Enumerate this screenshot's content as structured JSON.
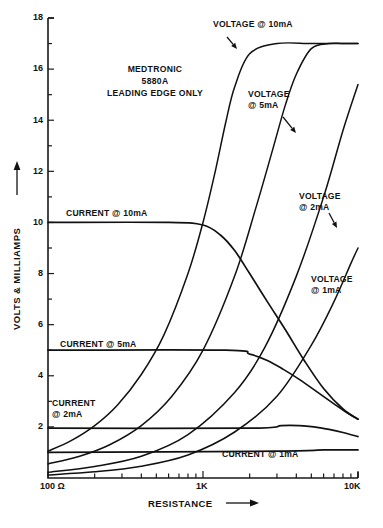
{
  "figure": {
    "title_block": [
      "MEDTRONIC",
      "5880A",
      "LEADING EDGE ONLY"
    ],
    "background_color": "#ffffff",
    "ink_color": "#111111"
  },
  "chart_data": {
    "type": "line",
    "title": "MEDTRONIC 5880A LEADING EDGE ONLY",
    "xlabel": "RESISTANCE",
    "ylabel": "VOLTS & MILLIAMPS",
    "x_scale": "log",
    "xlim": [
      100,
      10000
    ],
    "ylim": [
      0,
      18
    ],
    "grid": false,
    "legend": "inline-annotations",
    "x_tick_labels": [
      "100 Ω",
      "1K",
      "10K"
    ],
    "x_tick_values": [
      100,
      1000,
      10000
    ],
    "x_minor_ticks": [
      200,
      300,
      400,
      500,
      600,
      700,
      800,
      900,
      2000,
      3000,
      4000,
      5000,
      6000,
      7000,
      8000,
      9000
    ],
    "y_tick_labels": [
      "2",
      "4",
      "6",
      "8",
      "10",
      "12",
      "14",
      "16",
      "18"
    ],
    "y_tick_values": [
      2,
      4,
      6,
      8,
      10,
      12,
      14,
      16,
      18
    ],
    "y_minor_ticks": [
      1,
      3,
      5,
      7,
      9,
      11,
      13,
      15,
      17
    ],
    "series": [
      {
        "name": "VOLTAGE @ 10mA",
        "kind": "voltage",
        "unit": "V",
        "x": [
          100,
          140,
          200,
          280,
          400,
          560,
          800,
          1000,
          1200,
          1400,
          1600,
          2000,
          3000,
          5000,
          8000,
          10000
        ],
        "values": [
          1.05,
          1.45,
          2.05,
          2.85,
          4.05,
          5.6,
          8.0,
          10.0,
          12.0,
          13.9,
          15.3,
          16.6,
          17.0,
          17.0,
          17.0,
          17.0
        ]
      },
      {
        "name": "VOLTAGE @ 5mA",
        "kind": "voltage",
        "unit": "V",
        "x": [
          100,
          160,
          250,
          400,
          630,
          1000,
          1600,
          2200,
          2800,
          3400,
          4000,
          5000,
          6500,
          8000,
          10000
        ],
        "values": [
          0.55,
          0.85,
          1.3,
          2.05,
          3.2,
          5.0,
          7.9,
          10.6,
          12.8,
          14.6,
          15.8,
          16.8,
          17.0,
          17.0,
          17.0
        ]
      },
      {
        "name": "VOLTAGE @ 2mA",
        "kind": "voltage",
        "unit": "V",
        "x": [
          100,
          200,
          400,
          800,
          1600,
          2500,
          4000,
          6000,
          8000,
          10000
        ],
        "values": [
          0.22,
          0.45,
          0.85,
          1.7,
          3.35,
          5.1,
          7.9,
          11.0,
          13.6,
          15.4
        ]
      },
      {
        "name": "VOLTAGE @ 1mA",
        "kind": "voltage",
        "unit": "V",
        "x": [
          100,
          200,
          400,
          800,
          1600,
          3000,
          5000,
          7000,
          9000,
          10000
        ],
        "values": [
          0.12,
          0.24,
          0.46,
          0.9,
          1.8,
          3.2,
          5.2,
          6.9,
          8.4,
          9.0
        ]
      },
      {
        "name": "CURRENT @ 10mA",
        "kind": "current",
        "unit": "mA",
        "x": [
          100,
          600,
          1000,
          1300,
          1600,
          2000,
          2600,
          3400,
          4500,
          6000,
          8000,
          10000
        ],
        "values": [
          10.0,
          10.0,
          9.9,
          9.5,
          8.9,
          8.0,
          6.9,
          5.8,
          4.6,
          3.5,
          2.7,
          2.3
        ]
      },
      {
        "name": "CURRENT @ 5mA",
        "kind": "current",
        "unit": "mA",
        "x": [
          100,
          1400,
          2000,
          2600,
          3300,
          4200,
          5500,
          7000,
          8500,
          10000
        ],
        "values": [
          5.0,
          5.0,
          4.85,
          4.6,
          4.25,
          3.85,
          3.35,
          2.9,
          2.55,
          2.3
        ]
      },
      {
        "name": "CURRENT @ 2mA",
        "kind": "current",
        "unit": "mA",
        "x": [
          100,
          2000,
          3200,
          4200,
          5200,
          6500,
          8000,
          10000
        ],
        "values": [
          1.95,
          1.95,
          2.05,
          2.05,
          2.0,
          1.9,
          1.78,
          1.62
        ]
      },
      {
        "name": "CURRENT @ 1mA",
        "kind": "current",
        "unit": "mA",
        "x": [
          100,
          3000,
          6000,
          8000,
          10000
        ],
        "values": [
          1.0,
          1.05,
          1.1,
          1.1,
          1.1
        ]
      }
    ],
    "annotations": [
      {
        "id": "voltage-10ma",
        "lines": [
          "VOLTAGE @ 10mA"
        ],
        "x": 213,
        "y": 27,
        "has_arrow": true
      },
      {
        "id": "voltage-5ma",
        "lines": [
          "VOLTAGE",
          "@ 5mA"
        ],
        "x": 248,
        "y": 97,
        "has_arrow": true
      },
      {
        "id": "voltage-2ma",
        "lines": [
          "VOLTAGE",
          "@ 2mA"
        ],
        "x": 299,
        "y": 199,
        "has_arrow": true
      },
      {
        "id": "voltage-1ma",
        "lines": [
          "VOLTAGE",
          "@ 1mA"
        ],
        "x": 311,
        "y": 282,
        "has_arrow": false
      },
      {
        "id": "current-10ma",
        "lines": [
          "CURRENT @ 10mA"
        ],
        "x": 66,
        "y": 216,
        "has_arrow": false
      },
      {
        "id": "current-5ma",
        "lines": [
          "CURRENT @ 5mA"
        ],
        "x": 60,
        "y": 347,
        "has_arrow": false
      },
      {
        "id": "current-2ma",
        "lines": [
          "CURRENT",
          "@ 2mA"
        ],
        "x": 52,
        "y": 406,
        "has_arrow": false
      },
      {
        "id": "current-1mA",
        "lines": [
          "CURRENT @ 1mA"
        ],
        "x": 222,
        "y": 457,
        "has_arrow": false
      }
    ]
  }
}
